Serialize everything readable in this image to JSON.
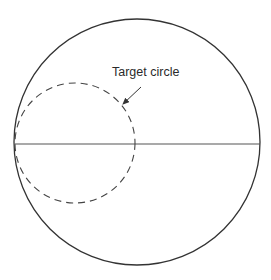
{
  "diagram": {
    "label": "Target circle",
    "colors": {
      "background": "#ffffff",
      "stroke": "#333333"
    },
    "outer_circle": {
      "cx": 137,
      "cy": 142,
      "r": 123
    },
    "target_circle": {
      "cx": 75,
      "cy": 143,
      "r": 60,
      "style": "dashed"
    },
    "diameter_line": {
      "x1": 15,
      "y1": 144,
      "x2": 260,
      "y2": 144
    },
    "arrow": {
      "x1": 141,
      "y1": 87,
      "x2": 122,
      "y2": 105
    },
    "label_pos": {
      "x": 112,
      "y": 76
    }
  }
}
